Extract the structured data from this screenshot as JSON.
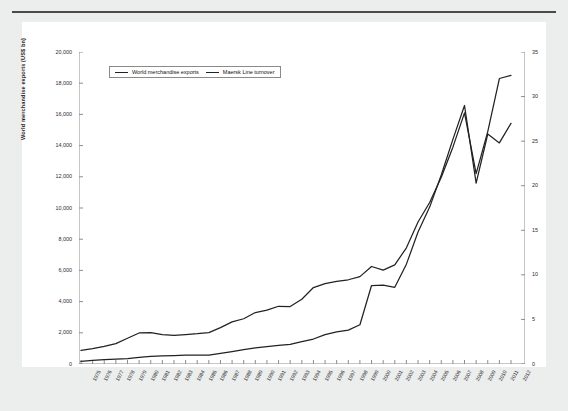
{
  "page": {
    "background": "#eceded",
    "panel_background": "#ffffff",
    "rule_color": "#4a4a4a"
  },
  "legend": {
    "position": "top-left-inside",
    "entries": [
      {
        "label": "World merchandise exports",
        "color": "#222222"
      },
      {
        "label": "Maersk Line turnover",
        "color": "#222222"
      }
    ]
  },
  "axes": {
    "left": {
      "title": "World merchandise exports (US$ bn)",
      "ticks": [
        "0",
        "2,000",
        "4,000",
        "6,000",
        "8,000",
        "10,000",
        "12,000",
        "14,000",
        "16,000",
        "18,000",
        "20,000"
      ],
      "min": 0,
      "max": 20000,
      "step": 2000
    },
    "right": {
      "title": "Maersk Line turnover (US$bn)",
      "ticks": [
        "0",
        "5",
        "10",
        "15",
        "20",
        "25",
        "30",
        "35"
      ],
      "min": 0,
      "max": 35,
      "step": 5
    },
    "bottom": {
      "title": "",
      "ticks": [
        "1975",
        "1976",
        "1977",
        "1978",
        "1979",
        "1980",
        "1981",
        "1982",
        "1983",
        "1984",
        "1985",
        "1986",
        "1987",
        "1988",
        "1989",
        "1990",
        "1991",
        "1992",
        "1993",
        "1994",
        "1995",
        "1996",
        "1997",
        "1998",
        "1999",
        "2000",
        "2001",
        "2002",
        "2003",
        "2004",
        "2005",
        "2006",
        "2007",
        "2008",
        "2009",
        "2010",
        "2011",
        "2012"
      ]
    }
  },
  "chart_data": {
    "type": "line",
    "title": "",
    "xlabel": "",
    "ylabel": "World merchandise exports (US$ bn)",
    "y2label": "Maersk Line turnover (US$bn)",
    "grid": false,
    "legend_position": "upper left",
    "xlim": [
      1975,
      2012
    ],
    "ylim": [
      0,
      20000
    ],
    "y2lim": [
      0,
      35
    ],
    "x": [
      1975,
      1976,
      1977,
      1978,
      1979,
      1980,
      1981,
      1982,
      1983,
      1984,
      1985,
      1986,
      1987,
      1988,
      1989,
      1990,
      1991,
      1992,
      1993,
      1994,
      1995,
      1996,
      1997,
      1998,
      1999,
      2000,
      2001,
      2002,
      2003,
      2004,
      2005,
      2006,
      2007,
      2008,
      2009,
      2010,
      2011,
      2012
    ],
    "series": [
      {
        "name": "World merchandise exports",
        "axis": "left",
        "unit": "US$ bn",
        "color": "#222222",
        "values": [
          870,
          990,
          1130,
          1310,
          1650,
          1990,
          2010,
          1880,
          1830,
          1890,
          1940,
          2010,
          2330,
          2700,
          2900,
          3300,
          3450,
          3700,
          3680,
          4150,
          4900,
          5150,
          5300,
          5400,
          5600,
          6250,
          6020,
          6350,
          7450,
          9100,
          10350,
          11970,
          13900,
          16100,
          12200,
          14900,
          18300,
          18500
        ]
      },
      {
        "name": "Maersk Line turnover",
        "axis": "right",
        "unit": "US$bn",
        "color": "#222222",
        "values": [
          0.3,
          0.4,
          0.5,
          0.55,
          0.6,
          0.75,
          0.85,
          0.9,
          0.95,
          1.0,
          1.0,
          1.0,
          1.2,
          1.4,
          1.6,
          1.8,
          1.95,
          2.1,
          2.2,
          2.5,
          2.8,
          3.3,
          3.6,
          3.8,
          4.4,
          8.8,
          8.85,
          8.6,
          11.2,
          14.8,
          17.6,
          21.2,
          25.2,
          29.0,
          20.3,
          25.8,
          24.8,
          27.0
        ]
      }
    ]
  }
}
